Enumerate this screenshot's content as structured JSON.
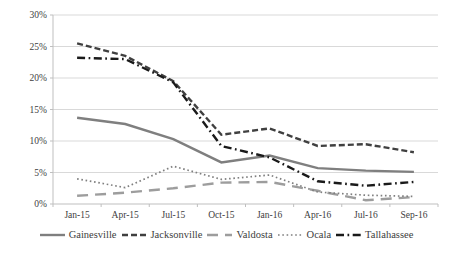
{
  "chart_data": {
    "type": "line",
    "title": "",
    "xlabel": "",
    "ylabel": "",
    "categories": [
      "Jan-15",
      "Apr-15",
      "Jul-15",
      "Oct-15",
      "Jan-16",
      "Apr-16",
      "Jul-16",
      "Sep-16"
    ],
    "series": [
      {
        "name": "Gainesville",
        "values": [
          13.7,
          12.7,
          10.3,
          6.6,
          7.7,
          5.7,
          5.3,
          5.1
        ],
        "color": "#7f7f7f",
        "dash": "solid",
        "width": 2.4
      },
      {
        "name": "Jacksonville",
        "values": [
          25.5,
          23.5,
          19.5,
          11.0,
          12.0,
          9.2,
          9.5,
          8.2
        ],
        "color": "#404040",
        "dash": "dash",
        "width": 2.4
      },
      {
        "name": "Valdosta",
        "values": [
          1.3,
          1.8,
          2.5,
          3.4,
          3.5,
          2.1,
          0.6,
          1.1
        ],
        "color": "#9d9d9d",
        "dash": "longdash",
        "width": 2.4
      },
      {
        "name": "Ocala",
        "values": [
          4.0,
          2.6,
          6.0,
          3.9,
          4.6,
          1.9,
          1.4,
          1.2
        ],
        "color": "#7f7f7f",
        "dash": "dot",
        "width": 1.7
      },
      {
        "name": "Tallahassee",
        "values": [
          23.2,
          23.0,
          19.3,
          9.2,
          7.4,
          3.6,
          2.9,
          3.5
        ],
        "color": "#1a1a1a",
        "dash": "dashdot",
        "width": 2.4
      }
    ],
    "ylim": [
      0,
      30
    ],
    "ytick_step": 5,
    "ytick_labels": [
      "0%",
      "5%",
      "10%",
      "15%",
      "20%",
      "25%",
      "30%"
    ],
    "grid": true,
    "gridline_color": "#d9d9d9",
    "axis_color": "#bfbfbf",
    "text_color": "#404040",
    "legend_position": "bottom"
  }
}
